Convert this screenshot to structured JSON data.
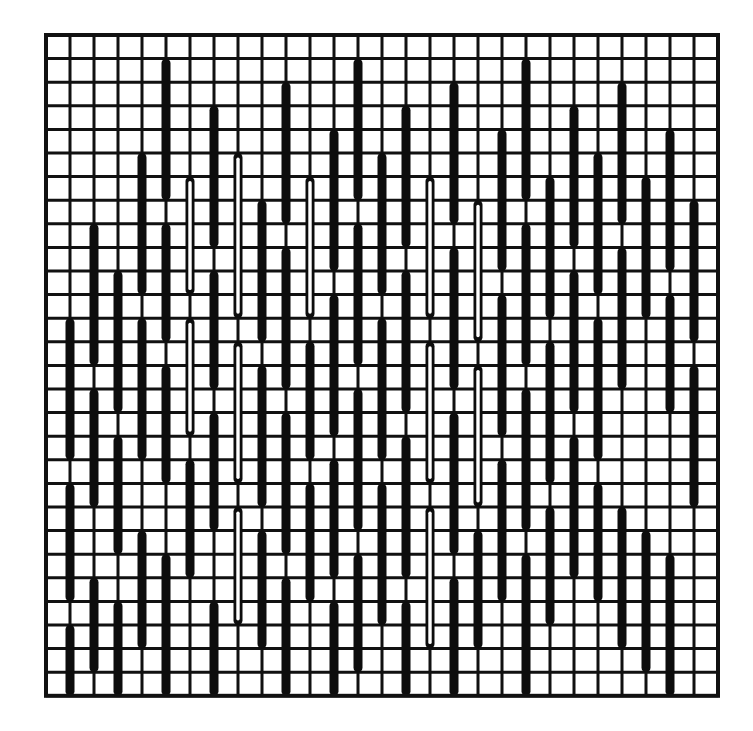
{
  "figure": {
    "title": "",
    "caption": "",
    "background_color": "#ffffff",
    "ink_color": "#111111"
  },
  "chart_data": {
    "type": "heatmap",
    "title": "",
    "subtitle": "",
    "xlabel": "",
    "ylabel": "",
    "grid": true,
    "legend_position": "none",
    "xlim": [
      0,
      28
    ],
    "ylim": [
      0,
      28
    ],
    "categories": [],
    "values": [],
    "grid_spec": {
      "columns": 28,
      "rows": 28,
      "cell_width_px": 24,
      "cell_height_px": 23.6,
      "origin_x_px": 46,
      "origin_y_px": 35,
      "line_width_px": 3,
      "line_color": "#111111"
    },
    "bar_spec": {
      "width_px": 9,
      "cap": "round",
      "solid_color": "#0d0d0d",
      "hollow_core_color": "#ffffff",
      "hollow_core_width_px": 3.4,
      "styles": [
        "solid",
        "hollow"
      ]
    },
    "bars": [
      {
        "col": 2,
        "r0": 8,
        "r1": 14,
        "style": "solid"
      },
      {
        "col": 2,
        "r0": 15,
        "r1": 20,
        "style": "solid"
      },
      {
        "col": 2,
        "r0": 23,
        "r1": 27,
        "style": "solid"
      },
      {
        "col": 3,
        "r0": 10,
        "r1": 16,
        "style": "solid"
      },
      {
        "col": 3,
        "r0": 17,
        "r1": 22,
        "style": "solid"
      },
      {
        "col": 3,
        "r0": 24,
        "r1": 28,
        "style": "solid"
      },
      {
        "col": 4,
        "r0": 5,
        "r1": 11,
        "style": "solid"
      },
      {
        "col": 4,
        "r0": 12,
        "r1": 18,
        "style": "solid"
      },
      {
        "col": 4,
        "r0": 21,
        "r1": 26,
        "style": "solid"
      },
      {
        "col": 5,
        "r0": 1,
        "r1": 7,
        "style": "solid"
      },
      {
        "col": 5,
        "r0": 8,
        "r1": 13,
        "style": "solid"
      },
      {
        "col": 5,
        "r0": 14,
        "r1": 19,
        "style": "solid"
      },
      {
        "col": 5,
        "r0": 22,
        "r1": 28,
        "style": "solid"
      },
      {
        "col": 6,
        "r0": 6,
        "r1": 11,
        "style": "hollow"
      },
      {
        "col": 6,
        "r0": 12,
        "r1": 17,
        "style": "hollow"
      },
      {
        "col": 6,
        "r0": 18,
        "r1": 23,
        "style": "solid"
      },
      {
        "col": 7,
        "r0": 3,
        "r1": 9,
        "style": "solid"
      },
      {
        "col": 7,
        "r0": 10,
        "r1": 15,
        "style": "solid"
      },
      {
        "col": 7,
        "r0": 16,
        "r1": 21,
        "style": "solid"
      },
      {
        "col": 7,
        "r0": 24,
        "r1": 28,
        "style": "solid"
      },
      {
        "col": 8,
        "r0": 5,
        "r1": 12,
        "style": "hollow"
      },
      {
        "col": 8,
        "r0": 13,
        "r1": 19,
        "style": "hollow"
      },
      {
        "col": 8,
        "r0": 20,
        "r1": 25,
        "style": "hollow"
      },
      {
        "col": 9,
        "r0": 7,
        "r1": 13,
        "style": "solid"
      },
      {
        "col": 9,
        "r0": 14,
        "r1": 20,
        "style": "solid"
      },
      {
        "col": 9,
        "r0": 21,
        "r1": 26,
        "style": "solid"
      },
      {
        "col": 10,
        "r0": 2,
        "r1": 8,
        "style": "solid"
      },
      {
        "col": 10,
        "r0": 9,
        "r1": 15,
        "style": "solid"
      },
      {
        "col": 10,
        "r0": 16,
        "r1": 22,
        "style": "solid"
      },
      {
        "col": 10,
        "r0": 23,
        "r1": 28,
        "style": "solid"
      },
      {
        "col": 11,
        "r0": 6,
        "r1": 12,
        "style": "hollow"
      },
      {
        "col": 11,
        "r0": 13,
        "r1": 18,
        "style": "solid"
      },
      {
        "col": 11,
        "r0": 19,
        "r1": 24,
        "style": "solid"
      },
      {
        "col": 12,
        "r0": 4,
        "r1": 10,
        "style": "solid"
      },
      {
        "col": 12,
        "r0": 11,
        "r1": 17,
        "style": "solid"
      },
      {
        "col": 12,
        "r0": 18,
        "r1": 23,
        "style": "solid"
      },
      {
        "col": 12,
        "r0": 24,
        "r1": 28,
        "style": "solid"
      },
      {
        "col": 13,
        "r0": 1,
        "r1": 7,
        "style": "solid"
      },
      {
        "col": 13,
        "r0": 8,
        "r1": 14,
        "style": "solid"
      },
      {
        "col": 13,
        "r0": 15,
        "r1": 21,
        "style": "solid"
      },
      {
        "col": 13,
        "r0": 22,
        "r1": 27,
        "style": "solid"
      },
      {
        "col": 14,
        "r0": 5,
        "r1": 11,
        "style": "solid"
      },
      {
        "col": 14,
        "r0": 12,
        "r1": 18,
        "style": "solid"
      },
      {
        "col": 14,
        "r0": 19,
        "r1": 25,
        "style": "solid"
      },
      {
        "col": 15,
        "r0": 3,
        "r1": 9,
        "style": "solid"
      },
      {
        "col": 15,
        "r0": 10,
        "r1": 16,
        "style": "solid"
      },
      {
        "col": 15,
        "r0": 17,
        "r1": 23,
        "style": "solid"
      },
      {
        "col": 15,
        "r0": 24,
        "r1": 28,
        "style": "solid"
      },
      {
        "col": 16,
        "r0": 6,
        "r1": 12,
        "style": "hollow"
      },
      {
        "col": 16,
        "r0": 13,
        "r1": 19,
        "style": "hollow"
      },
      {
        "col": 16,
        "r0": 20,
        "r1": 26,
        "style": "hollow"
      },
      {
        "col": 17,
        "r0": 2,
        "r1": 8,
        "style": "solid"
      },
      {
        "col": 17,
        "r0": 9,
        "r1": 15,
        "style": "solid"
      },
      {
        "col": 17,
        "r0": 16,
        "r1": 22,
        "style": "solid"
      },
      {
        "col": 17,
        "r0": 23,
        "r1": 28,
        "style": "solid"
      },
      {
        "col": 18,
        "r0": 7,
        "r1": 13,
        "style": "hollow"
      },
      {
        "col": 18,
        "r0": 14,
        "r1": 20,
        "style": "hollow"
      },
      {
        "col": 18,
        "r0": 21,
        "r1": 26,
        "style": "solid"
      },
      {
        "col": 19,
        "r0": 4,
        "r1": 10,
        "style": "solid"
      },
      {
        "col": 19,
        "r0": 11,
        "r1": 17,
        "style": "solid"
      },
      {
        "col": 19,
        "r0": 18,
        "r1": 24,
        "style": "solid"
      },
      {
        "col": 20,
        "r0": 1,
        "r1": 7,
        "style": "solid"
      },
      {
        "col": 20,
        "r0": 8,
        "r1": 14,
        "style": "solid"
      },
      {
        "col": 20,
        "r0": 15,
        "r1": 21,
        "style": "solid"
      },
      {
        "col": 20,
        "r0": 22,
        "r1": 28,
        "style": "solid"
      },
      {
        "col": 21,
        "r0": 6,
        "r1": 12,
        "style": "solid"
      },
      {
        "col": 21,
        "r0": 13,
        "r1": 19,
        "style": "solid"
      },
      {
        "col": 21,
        "r0": 20,
        "r1": 25,
        "style": "solid"
      },
      {
        "col": 22,
        "r0": 3,
        "r1": 9,
        "style": "solid"
      },
      {
        "col": 22,
        "r0": 10,
        "r1": 16,
        "style": "solid"
      },
      {
        "col": 22,
        "r0": 17,
        "r1": 23,
        "style": "solid"
      },
      {
        "col": 23,
        "r0": 5,
        "r1": 11,
        "style": "solid"
      },
      {
        "col": 23,
        "r0": 12,
        "r1": 18,
        "style": "solid"
      },
      {
        "col": 23,
        "r0": 19,
        "r1": 24,
        "style": "solid"
      },
      {
        "col": 24,
        "r0": 2,
        "r1": 8,
        "style": "solid"
      },
      {
        "col": 24,
        "r0": 9,
        "r1": 15,
        "style": "solid"
      },
      {
        "col": 24,
        "r0": 20,
        "r1": 26,
        "style": "solid"
      },
      {
        "col": 25,
        "r0": 6,
        "r1": 12,
        "style": "solid"
      },
      {
        "col": 25,
        "r0": 21,
        "r1": 27,
        "style": "solid"
      },
      {
        "col": 26,
        "r0": 4,
        "r1": 10,
        "style": "solid"
      },
      {
        "col": 26,
        "r0": 11,
        "r1": 16,
        "style": "solid"
      },
      {
        "col": 26,
        "r0": 22,
        "r1": 28,
        "style": "solid"
      },
      {
        "col": 27,
        "r0": 7,
        "r1": 13,
        "style": "solid"
      },
      {
        "col": 27,
        "r0": 14,
        "r1": 20,
        "style": "solid"
      },
      {
        "col": 1,
        "r0": 12,
        "r1": 18,
        "style": "solid"
      },
      {
        "col": 1,
        "r0": 19,
        "r1": 24,
        "style": "solid"
      },
      {
        "col": 1,
        "r0": 25,
        "r1": 28,
        "style": "solid"
      }
    ]
  }
}
